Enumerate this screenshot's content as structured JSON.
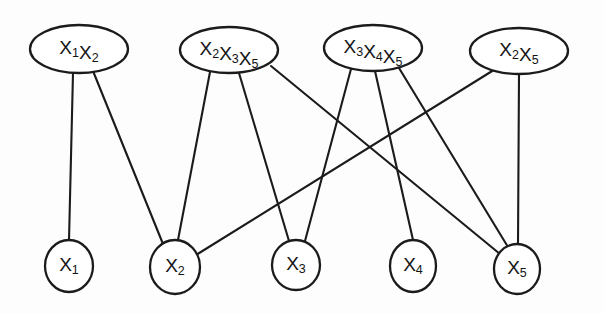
{
  "diagram": {
    "type": "factor-graph",
    "title": "",
    "background_color": "#fdfdfd",
    "stroke_color": "#1b1b1b",
    "fill_color": "#ffffff",
    "factor_nodes": [
      {
        "id": "f1",
        "label": "X1X2",
        "terms": [
          {
            "base": "X",
            "sub": "1"
          },
          {
            "base": "X",
            "sub": "2"
          }
        ],
        "shape": "ellipse",
        "cx": 79,
        "cy": 49,
        "rx": 49,
        "ry": 24
      },
      {
        "id": "f2",
        "label": "X2X3X5",
        "terms": [
          {
            "base": "X",
            "sub": "2"
          },
          {
            "base": "X",
            "sub": "3"
          },
          {
            "base": "X",
            "sub": "5"
          }
        ],
        "shape": "ellipse",
        "cx": 229,
        "cy": 50,
        "rx": 49,
        "ry": 23
      },
      {
        "id": "f3",
        "label": "X3X4X5",
        "terms": [
          {
            "base": "X",
            "sub": "3"
          },
          {
            "base": "X",
            "sub": "4"
          },
          {
            "base": "X",
            "sub": "5"
          }
        ],
        "shape": "ellipse",
        "cx": 373,
        "cy": 48,
        "rx": 49,
        "ry": 23
      },
      {
        "id": "f4",
        "label": "X2X5",
        "terms": [
          {
            "base": "X",
            "sub": "2"
          },
          {
            "base": "X",
            "sub": "5"
          }
        ],
        "shape": "ellipse",
        "cx": 519,
        "cy": 51,
        "rx": 49,
        "ry": 23
      }
    ],
    "variable_nodes": [
      {
        "id": "v1",
        "label": "X1",
        "base": "X",
        "sub": "1",
        "shape": "circle",
        "cx": 69,
        "cy": 266,
        "rx": 24,
        "ry": 26
      },
      {
        "id": "v2",
        "label": "X2",
        "base": "X",
        "sub": "2",
        "shape": "circle",
        "cx": 175,
        "cy": 267,
        "rx": 25,
        "ry": 27
      },
      {
        "id": "v3",
        "label": "X3",
        "base": "X",
        "sub": "3",
        "shape": "circle",
        "cx": 296,
        "cy": 265,
        "rx": 24,
        "ry": 25
      },
      {
        "id": "v4",
        "label": "X4",
        "base": "X",
        "sub": "4",
        "shape": "circle",
        "cx": 413,
        "cy": 266,
        "rx": 23,
        "ry": 26
      },
      {
        "id": "v5",
        "label": "X5",
        "base": "X",
        "sub": "5",
        "shape": "circle",
        "cx": 517,
        "cy": 269,
        "rx": 23,
        "ry": 25
      }
    ],
    "edges": [
      {
        "from": "f1",
        "to": "v1",
        "x1": 73,
        "y1": 73,
        "x2": 69,
        "y2": 240
      },
      {
        "from": "f1",
        "to": "v2",
        "x1": 93,
        "y1": 71,
        "x2": 163,
        "y2": 244
      },
      {
        "from": "f2",
        "to": "v2",
        "x1": 210,
        "y1": 72,
        "x2": 178,
        "y2": 240
      },
      {
        "from": "f2",
        "to": "v3",
        "x1": 239,
        "y1": 73,
        "x2": 289,
        "y2": 241
      },
      {
        "from": "f2",
        "to": "v5",
        "x1": 271,
        "y1": 66,
        "x2": 500,
        "y2": 254
      },
      {
        "from": "f3",
        "to": "v3",
        "x1": 351,
        "y1": 69,
        "x2": 305,
        "y2": 241
      },
      {
        "from": "f3",
        "to": "v4",
        "x1": 375,
        "y1": 71,
        "x2": 413,
        "y2": 240
      },
      {
        "from": "f3",
        "to": "v5",
        "x1": 399,
        "y1": 68,
        "x2": 508,
        "y2": 247
      },
      {
        "from": "f4",
        "to": "v2",
        "x1": 497,
        "y1": 68,
        "x2": 196,
        "y2": 255
      },
      {
        "from": "f4",
        "to": "v5",
        "x1": 519,
        "y1": 74,
        "x2": 518,
        "y2": 244
      }
    ]
  }
}
